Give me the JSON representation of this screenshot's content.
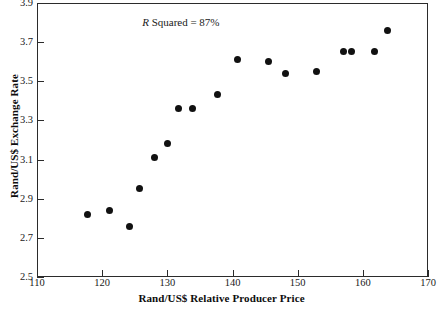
{
  "chart_data": {
    "type": "scatter",
    "title": "",
    "xlabel": "Rand/US$ Relative Producer Price",
    "ylabel": "Rand/US$ Exchange Rate",
    "xlim": [
      110,
      170
    ],
    "ylim": [
      2.5,
      3.9
    ],
    "xticks": [
      110,
      120,
      130,
      140,
      150,
      160,
      170
    ],
    "yticks": [
      2.5,
      2.7,
      2.9,
      3.1,
      3.3,
      3.5,
      3.7,
      3.9
    ],
    "xtick_labels": [
      "110",
      "120",
      "130",
      "140",
      "150",
      "160",
      "170"
    ],
    "ytick_labels": [
      "2.5",
      "2.7",
      "2.9",
      "3.1",
      "3.3",
      "3.5",
      "3.7",
      "3.9"
    ],
    "grid": false,
    "legend": null,
    "marker_color": "#111111",
    "frame_color": "#2b2b2b",
    "background": "#ffffff",
    "annotation": {
      "italic_prefix": "R",
      "text": " Squared = 87%",
      "full_text": "R Squared = 87%",
      "x": 133.5,
      "y": 3.8
    },
    "points": [
      {
        "x": 117.8,
        "y": 2.82
      },
      {
        "x": 121.2,
        "y": 2.84
      },
      {
        "x": 124.2,
        "y": 2.76
      },
      {
        "x": 125.8,
        "y": 2.95
      },
      {
        "x": 128.0,
        "y": 3.11
      },
      {
        "x": 130.0,
        "y": 3.18
      },
      {
        "x": 131.7,
        "y": 3.36
      },
      {
        "x": 133.9,
        "y": 3.36
      },
      {
        "x": 137.7,
        "y": 3.43
      },
      {
        "x": 140.8,
        "y": 3.61
      },
      {
        "x": 145.5,
        "y": 3.6
      },
      {
        "x": 148.2,
        "y": 3.54
      },
      {
        "x": 152.9,
        "y": 3.55
      },
      {
        "x": 157.1,
        "y": 3.65
      },
      {
        "x": 158.3,
        "y": 3.65
      },
      {
        "x": 161.8,
        "y": 3.65
      },
      {
        "x": 163.8,
        "y": 3.76
      }
    ]
  }
}
